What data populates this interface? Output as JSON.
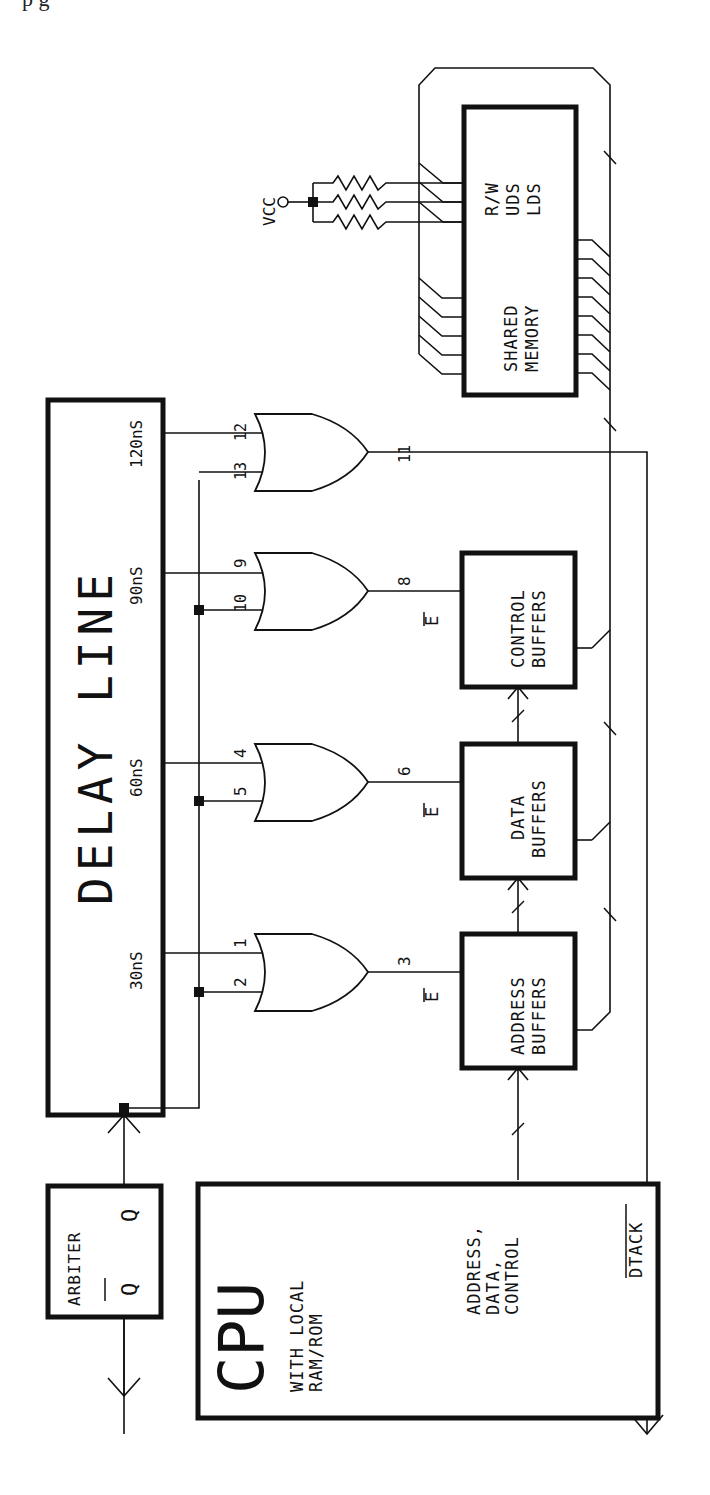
{
  "page_fragment": "p   g",
  "diagram": {
    "orientation": "rotated-90-ccw",
    "delay_line": {
      "title": "DELAY LINE",
      "taps": [
        "30nS",
        "60nS",
        "90nS",
        "120nS"
      ]
    },
    "gates": [
      {
        "inputs": [
          "1",
          "2"
        ],
        "output": "3",
        "enable": "E"
      },
      {
        "inputs": [
          "4",
          "5"
        ],
        "output": "6",
        "enable": "E"
      },
      {
        "inputs": [
          "9",
          "10"
        ],
        "output": "8",
        "enable": "E"
      },
      {
        "inputs": [
          "12",
          "13"
        ],
        "output": "11"
      }
    ],
    "buffers": [
      {
        "line1": "ADDRESS",
        "line2": "BUFFERS"
      },
      {
        "line1": "DATA",
        "line2": "BUFFERS"
      },
      {
        "line1": "CONTROL",
        "line2": "BUFFERS"
      }
    ],
    "memory": {
      "line1": "SHARED",
      "line2": "MEMORY",
      "signals": [
        "R/W",
        "UDS",
        "LDS"
      ],
      "supply": "VCC"
    },
    "arbiter": {
      "title": "ARBITER",
      "q": "Q",
      "q_bar": "Q"
    },
    "cpu": {
      "title": "CPU",
      "subtitle_1": "WITH LOCAL",
      "subtitle_2": "RAM/ROM",
      "bus_1": "ADDRESS,",
      "bus_2": "DATA,",
      "bus_3": "CONTROL",
      "dtack": "DTACK"
    }
  }
}
